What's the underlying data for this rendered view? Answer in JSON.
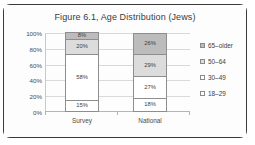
{
  "frame": {
    "border_color": "#3a3a3a",
    "background": "#ffffff"
  },
  "chart_data": {
    "type": "bar",
    "stacked": true,
    "title": "Figure 6.1, Age Distribution (Jews)",
    "xlabel": "",
    "ylabel": "",
    "categories": [
      "Survey",
      "National"
    ],
    "ytick_labels": [
      "100%",
      "80%",
      "60%",
      "40%",
      "20%",
      "0%"
    ],
    "ytick_values": [
      100,
      80,
      60,
      40,
      20,
      0
    ],
    "ylim": [
      0,
      100
    ],
    "grid": true,
    "legend_position": "right",
    "series": [
      {
        "name": "65–older",
        "color": "#bcbcbc",
        "values": [
          8,
          26
        ],
        "labels": [
          "8%",
          "26%"
        ]
      },
      {
        "name": "50–64",
        "color": "#dcdcdc",
        "values": [
          20,
          29
        ],
        "labels": [
          "20%",
          "29%"
        ]
      },
      {
        "name": "30–49",
        "color": "#ffffff",
        "values": [
          58,
          27
        ],
        "labels": [
          "58%",
          "27%"
        ]
      },
      {
        "name": "18–29",
        "color": "#ffffff",
        "values": [
          15,
          18
        ],
        "labels": [
          "15%",
          "18%"
        ]
      }
    ]
  }
}
